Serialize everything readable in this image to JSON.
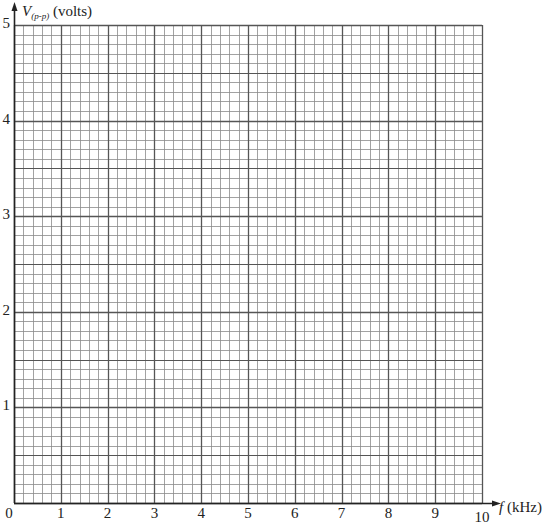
{
  "chart_data": {
    "type": "line",
    "title": "",
    "xlabel": {
      "symbol": "f",
      "unit": "(kHz)"
    },
    "ylabel": {
      "symbol": "V",
      "subscript": "(p-p)",
      "unit": "(volts)"
    },
    "xlim": [
      0,
      10
    ],
    "ylim": [
      0,
      5
    ],
    "x_ticks": [
      "0",
      "1",
      "2",
      "3",
      "4",
      "5",
      "6",
      "7",
      "8",
      "9",
      "10"
    ],
    "y_ticks": [
      "1",
      "2",
      "3",
      "4",
      "5"
    ],
    "grid": {
      "on": true,
      "x_minor_per_major": 5,
      "y_minor_per_major": 10,
      "y_medium_every": 5
    },
    "series": []
  },
  "colors": {
    "background": "#ffffff",
    "axis": "#222222",
    "major_grid": "#555555",
    "minor_grid": "#8a8a8a"
  }
}
